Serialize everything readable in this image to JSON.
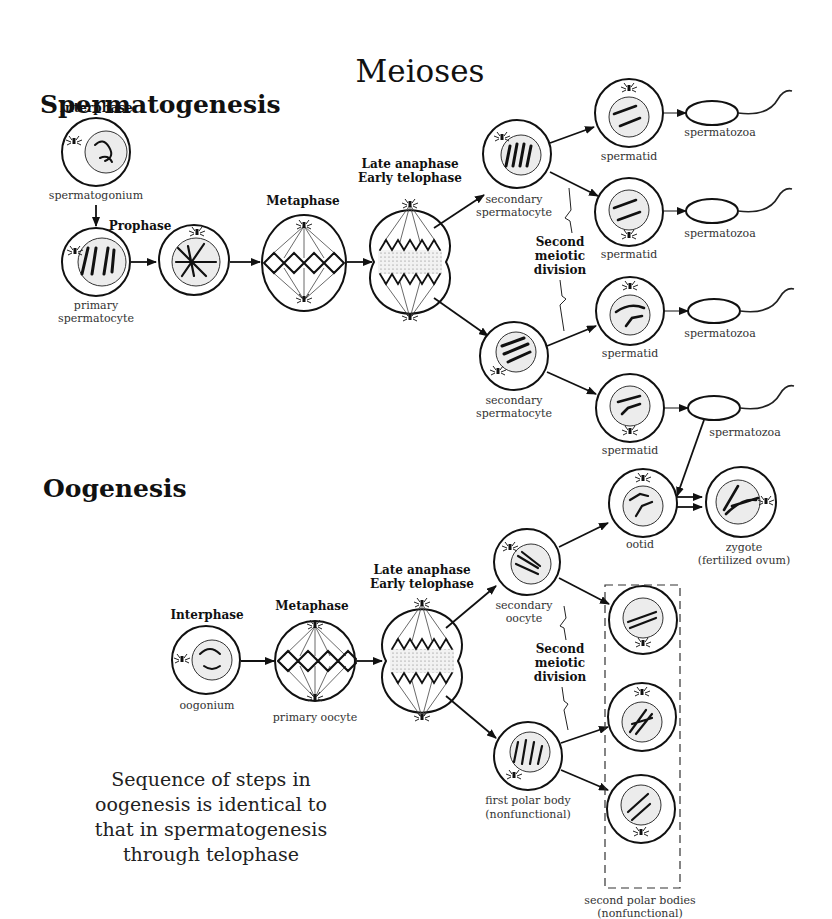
{
  "title": "Meioses",
  "spermatogenesis": {
    "heading": "Spermatogenesis",
    "phases": {
      "interphase": "Interphase",
      "prophase": "Prophase",
      "metaphase": "Metaphase",
      "late_anaphase": "Late anaphase",
      "early_telophase": "Early telophase"
    },
    "labels": {
      "spermatogonium": "spermatogonium",
      "primary_1": "primary",
      "primary_2": "spermatocyte",
      "secondary_1": "secondary",
      "secondary_2": "spermatocyte",
      "spermatid": "spermatid",
      "spermatozoa": "spermatozoa"
    },
    "second_division": [
      "Second",
      "meiotic",
      "division"
    ]
  },
  "oogenesis": {
    "heading": "Oogenesis",
    "phases": {
      "interphase": "Interphase",
      "metaphase": "Metaphase",
      "late_anaphase": "Late anaphase",
      "early_telophase": "Early telophase"
    },
    "labels": {
      "oogonium": "oogonium",
      "primary_oocyte": "primary oocyte",
      "secondary_1": "secondary",
      "secondary_2": "oocyte",
      "ootid": "ootid",
      "zygote_1": "zygote",
      "zygote_2": "(fertilized ovum)",
      "first_polar_1": "first polar body",
      "first_polar_2": "(nonfunctional)",
      "second_polar_1": "second polar bodies",
      "second_polar_2": "(nonfunctional)"
    },
    "second_division": [
      "Second",
      "meiotic",
      "division"
    ]
  },
  "note": [
    "Sequence of steps in",
    "oogenesis is identical to",
    "that in spermatogenesis",
    "through telophase"
  ]
}
